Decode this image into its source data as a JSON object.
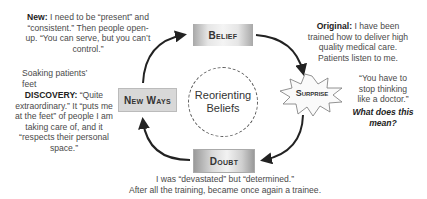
{
  "center": {
    "line1": "Reorienting",
    "line2": "Beliefs"
  },
  "stages": {
    "belief": "Belief",
    "surprise": "Surprise",
    "doubt": "Doubt",
    "new_ways": "New Ways"
  },
  "annotations": {
    "new": {
      "label": "New:",
      "text": "I need to be “present” and “consistent.” Then people open-up. “You can serve, but you can’t control.”"
    },
    "soaking": "Soaking patients’ feet",
    "discovery": {
      "label": "DISCOVERY:",
      "text": "“Quite extraordinary.” It “puts me at the feet” of people I am taking care of, and it “respects their personal space.”"
    },
    "original": {
      "label": "Original:",
      "text": "I have been trained how to deliver high quality medical care. Patients listen to me."
    },
    "quote": "“You have to stop thinking like a doctor.”",
    "question": "What does this mean?",
    "doubt_line1": "I was “devastated” but “determined.”",
    "doubt_line2": "After all the training, became once again a trainee."
  }
}
